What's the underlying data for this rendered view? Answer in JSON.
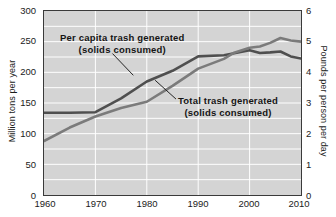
{
  "chart_data": {
    "type": "line",
    "title": "",
    "xlabel": "",
    "ylabel": "Million tons per year",
    "ylabel_right": "Pounds per person per day",
    "xlim": [
      1960,
      2010
    ],
    "ylim": [
      0,
      300
    ],
    "ylim_right": [
      0,
      6
    ],
    "grid": true,
    "grid_color": "#ffffff",
    "plot_background": "#d4d4d4",
    "legend_position": "inline-annotations",
    "xticks": [
      1960,
      1970,
      1980,
      1990,
      2000,
      2010
    ],
    "xtick_labels": [
      "1960",
      "1970",
      "1980",
      "1990",
      "2000",
      "2010"
    ],
    "yticks_left": [
      0,
      50,
      100,
      150,
      200,
      250,
      300
    ],
    "ytick_labels_left": [
      "0",
      "50",
      "100",
      "150",
      "200",
      "250",
      "300"
    ],
    "yticks_right": [
      0,
      1,
      2,
      3,
      4,
      5,
      6
    ],
    "ytick_labels_right": [
      "0",
      "1",
      "2",
      "3",
      "4",
      "5",
      "6"
    ],
    "x": [
      1960,
      1965,
      1970,
      1975,
      1980,
      1985,
      1990,
      1995,
      1997,
      2000,
      2002,
      2004,
      2006,
      2008,
      2010
    ],
    "series": [
      {
        "name": "Per capita trash generated (solids consumed)",
        "axis": "right",
        "unit": "pounds per person per day",
        "color": "#4f4f4f",
        "values": [
          2.68,
          2.68,
          2.7,
          3.15,
          3.7,
          4.05,
          4.52,
          4.56,
          4.62,
          4.72,
          4.63,
          4.65,
          4.68,
          4.52,
          4.45
        ]
      },
      {
        "name": "Total trash generated (solids consumed)",
        "axis": "left",
        "unit": "million tons per year",
        "color": "#7b7b7b",
        "values": [
          88,
          110,
          128,
          142,
          152,
          178,
          206,
          222,
          232,
          240,
          242,
          248,
          256,
          252,
          250
        ]
      }
    ],
    "annotations": [
      {
        "id": "per-capita",
        "line1": "Per capita trash generated",
        "line2": "(solids consumed)",
        "leader_from": [
          112,
          53
        ],
        "leader_to": [
          133,
          75
        ]
      },
      {
        "id": "total",
        "line1": "Total trash generated",
        "line2": "(solids consumed)",
        "leader_from": [
          176,
          99
        ],
        "leader_to": [
          155,
          80
        ]
      }
    ]
  }
}
